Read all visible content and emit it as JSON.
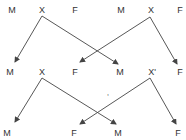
{
  "diagram": {
    "type": "crossing-scheme",
    "rows": [
      {
        "labels": [
          {
            "text": "M",
            "x": 12,
            "y": 10
          },
          {
            "text": "X",
            "x": 42,
            "y": 10
          },
          {
            "text": "F",
            "x": 75,
            "y": 10
          },
          {
            "text": "M",
            "x": 121,
            "y": 10
          },
          {
            "text": "X",
            "x": 151,
            "y": 10
          },
          {
            "text": "F",
            "x": 180,
            "y": 10
          }
        ]
      },
      {
        "labels": [
          {
            "text": "M",
            "x": 10,
            "y": 72
          },
          {
            "text": "X",
            "x": 42,
            "y": 72
          },
          {
            "text": "F",
            "x": 75,
            "y": 72
          },
          {
            "text": "M",
            "x": 120,
            "y": 72
          },
          {
            "text": "X'",
            "x": 152,
            "y": 72
          },
          {
            "text": "F",
            "x": 180,
            "y": 72
          }
        ]
      },
      {
        "labels": [
          {
            "text": "M",
            "x": 7,
            "y": 133
          },
          {
            "text": "F",
            "x": 74,
            "y": 133
          },
          {
            "text": "M",
            "x": 118,
            "y": 133
          },
          {
            "text": "F",
            "x": 178,
            "y": 133
          }
        ]
      }
    ],
    "arrows": [
      {
        "from": [
          42,
          16
        ],
        "to": [
          15,
          62
        ]
      },
      {
        "from": [
          42,
          16
        ],
        "to": [
          118,
          64
        ]
      },
      {
        "from": [
          150,
          17
        ],
        "to": [
          80,
          62
        ]
      },
      {
        "from": [
          150,
          17
        ],
        "to": [
          177,
          64
        ]
      },
      {
        "from": [
          42,
          78
        ],
        "to": [
          15,
          122
        ]
      },
      {
        "from": [
          42,
          78
        ],
        "to": [
          116,
          124
        ]
      },
      {
        "from": [
          150,
          78
        ],
        "to": [
          80,
          124
        ]
      },
      {
        "from": [
          150,
          78
        ],
        "to": [
          176,
          124
        ]
      }
    ],
    "line_color": "#444444",
    "text_color": "#333333",
    "stray_mark": {
      "text": ",",
      "x": 108,
      "y": 92
    }
  }
}
